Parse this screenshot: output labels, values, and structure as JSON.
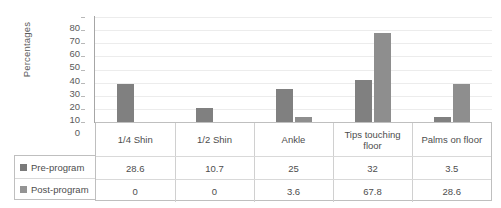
{
  "chart_data": {
    "type": "bar",
    "title": "",
    "subtitle": "",
    "xlabel": "",
    "ylabel": "Percentages",
    "ylim": [
      0,
      80
    ],
    "yticks": [
      80,
      70,
      60,
      50,
      40,
      30,
      20,
      10,
      0
    ],
    "grid": true,
    "legend_position": "table-left",
    "categories": [
      "1/4 Shin",
      "1/2 Shin",
      "Ankle",
      "Tips touching floor",
      "Palms on floor"
    ],
    "series": [
      {
        "name": "Pre-program",
        "color": "#808080",
        "values": [
          28.6,
          10.7,
          25,
          32,
          3.5
        ],
        "labels": [
          "28.6",
          "10.7",
          "25",
          "32",
          "3.5"
        ]
      },
      {
        "name": "Post-program",
        "color": "#8e8e8e",
        "values": [
          0,
          0,
          3.6,
          67.8,
          28.6
        ],
        "labels": [
          "0",
          "0",
          "3.6",
          "67.8",
          "28.6"
        ]
      }
    ]
  },
  "table": {
    "row_headers": [
      "Pre-program",
      "Post-program"
    ]
  },
  "colors": {
    "bar_pre": "#808080",
    "bar_post": "#8e8e8e",
    "gridline": "#ececec",
    "axis": "#a6a6a6",
    "table_border": "#bfbfbf",
    "text": "#4d4d4d",
    "background": "#ffffff"
  }
}
